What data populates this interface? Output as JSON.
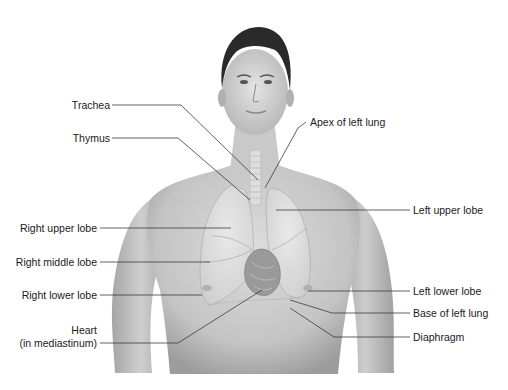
{
  "figure": {
    "colors": {
      "background": "#ffffff",
      "skin_light": "#d9d9d9",
      "skin_mid": "#bdbdbd",
      "skin_dark": "#8f8f8f",
      "hair": "#2a2a2a",
      "lung": "#e6e6e6",
      "heart": "#9a9a9a",
      "leader_line": "#3a3a3a",
      "label_text": "#1a1a1a"
    },
    "labels_left": [
      {
        "id": "trachea",
        "text": "Trachea"
      },
      {
        "id": "thymus",
        "text": "Thymus"
      },
      {
        "id": "right-upper-lobe",
        "text": "Right upper lobe"
      },
      {
        "id": "right-middle-lobe",
        "text": "Right middle lobe"
      },
      {
        "id": "right-lower-lobe",
        "text": "Right lower lobe"
      },
      {
        "id": "heart",
        "text": "Heart",
        "text2": "(in mediastinum)"
      }
    ],
    "labels_right": [
      {
        "id": "apex-of-left-lung",
        "text": "Apex of left lung"
      },
      {
        "id": "left-upper-lobe",
        "text": "Left upper lobe"
      },
      {
        "id": "left-lower-lobe",
        "text": "Left lower lobe"
      },
      {
        "id": "base-of-left-lung",
        "text": "Base of left lung"
      },
      {
        "id": "diaphragm",
        "text": "Diaphragm"
      }
    ]
  }
}
